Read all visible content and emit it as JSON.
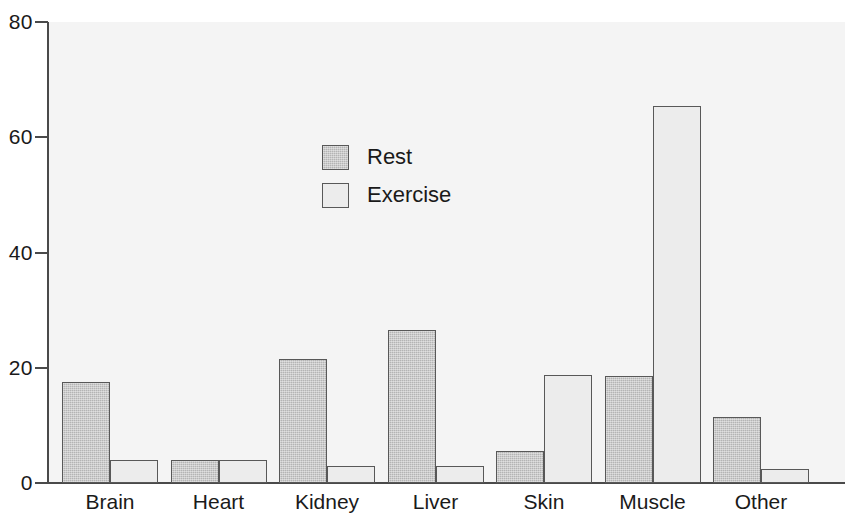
{
  "chart_data": {
    "type": "bar",
    "title": "",
    "subtitle": "",
    "xlabel": "",
    "ylabel": "",
    "ylim": [
      0,
      80
    ],
    "yticks": [
      0,
      20,
      40,
      60,
      80
    ],
    "ytick_labels": [
      "0",
      "20",
      "40",
      "60",
      "80"
    ],
    "grid": false,
    "legend_position": "inside-upper-center",
    "categories": [
      "Brain",
      "Heart",
      "Kidney",
      "Liver",
      "Skin",
      "Muscle",
      "Other"
    ],
    "series": [
      {
        "name": "Rest",
        "color": "#b4b4b4",
        "values": [
          17.5,
          4,
          21.5,
          26.5,
          5.5,
          18.5,
          11.5
        ]
      },
      {
        "name": "Exercise",
        "color": "#ececec",
        "values": [
          4,
          4,
          3,
          3,
          18.8,
          65.5,
          2.5
        ]
      }
    ]
  },
  "legend": {
    "items": [
      {
        "label": "Rest",
        "swatch": "rest"
      },
      {
        "label": "Exercise",
        "swatch": "exercise"
      }
    ]
  },
  "axis": {
    "y_labels": [
      "80",
      "60",
      "40",
      "20",
      "0"
    ]
  },
  "colors": {
    "plot_background": "#f4f4f4",
    "axis": "#4a4a4a",
    "bar_border": "#585858",
    "rest_fill": "#b4b4b4",
    "exercise_fill": "#ececec",
    "text": "#1a1a1a"
  }
}
